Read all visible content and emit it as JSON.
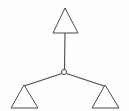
{
  "diagram": {
    "type": "node-link-graph",
    "canvas": {
      "width": 129,
      "height": 111,
      "background_color": "#fefefe"
    },
    "style": {
      "stroke_color": "#4a4a4a",
      "fill_color": "#fefefe",
      "stroke_width": 1.1
    },
    "center_node": {
      "name": "hub",
      "shape": "circle",
      "cx": 64,
      "cy": 72,
      "r": 2.6,
      "label": ""
    },
    "nodes": [
      {
        "name": "top-triangle",
        "shape": "triangle",
        "label": "",
        "apex": {
          "x": 65,
          "y": 8
        },
        "base_left": {
          "x": 53,
          "y": 33
        },
        "base_right": {
          "x": 78,
          "y": 33
        },
        "points": "65,8 53,33 78,33"
      },
      {
        "name": "bottom-left-triangle",
        "shape": "triangle",
        "label": "",
        "apex": {
          "x": 24,
          "y": 85
        },
        "base_left": {
          "x": 11,
          "y": 108
        },
        "base_right": {
          "x": 38,
          "y": 108
        },
        "points": "24,85 11,108 38,108"
      },
      {
        "name": "bottom-right-triangle",
        "shape": "triangle",
        "label": "",
        "apex": {
          "x": 105,
          "y": 85
        },
        "base_left": {
          "x": 92,
          "y": 108
        },
        "base_right": {
          "x": 119,
          "y": 108
        },
        "points": "105,85 92,108 119,108"
      }
    ],
    "edges": [
      {
        "name": "edge-hub-to-top",
        "from": "hub",
        "to": "top-triangle",
        "x1": 64.5,
        "y1": 70,
        "x2": 65,
        "y2": 33
      },
      {
        "name": "edge-hub-to-bottom-left",
        "from": "hub",
        "to": "bottom-left-triangle",
        "x1": 62,
        "y1": 73.5,
        "x2": 24,
        "y2": 86
      },
      {
        "name": "edge-hub-to-bottom-right",
        "from": "hub",
        "to": "bottom-right-triangle",
        "x1": 66.5,
        "y1": 73.5,
        "x2": 104,
        "y2": 86
      }
    ]
  }
}
